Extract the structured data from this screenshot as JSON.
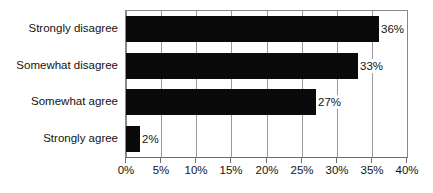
{
  "chart_data": {
    "type": "bar",
    "orientation": "horizontal",
    "title": "",
    "xlabel": "",
    "ylabel": "",
    "categories": [
      "Strongly disagree",
      "Somewhat disagree",
      "Somewhat agree",
      "Strongly agree"
    ],
    "values": [
      36,
      33,
      27,
      2
    ],
    "value_labels": [
      "36%",
      "33%",
      "27%",
      "2%"
    ],
    "xlim": [
      0,
      40
    ],
    "xtick_values": [
      0,
      5,
      10,
      15,
      20,
      25,
      30,
      35,
      40
    ],
    "xtick_labels": [
      "0%",
      "5%",
      "10%",
      "15%",
      "20%",
      "25%",
      "30%",
      "35%",
      "40%"
    ],
    "grid": "vertical",
    "legend": "none",
    "series": [
      {
        "name": "",
        "values": [
          36,
          33,
          27,
          2
        ],
        "color": "#0a0a0a"
      }
    ],
    "colors": {
      "bar": "#0a0a0a",
      "background": "#ffffff",
      "gridline": "#9a9a9a",
      "axis": "#6e6e6e",
      "text": "#131313"
    }
  }
}
